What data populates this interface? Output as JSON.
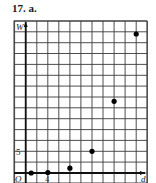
{
  "figure": {
    "title": "17. a."
  },
  "chart_data": {
    "type": "scatter",
    "title": "17. a.",
    "xlabel": "d",
    "ylabel": "W",
    "origin_label": "O",
    "x_tick_labels": [
      {
        "value": 4,
        "label": "4"
      }
    ],
    "y_tick_labels": [
      {
        "value": 5,
        "label": "5"
      }
    ],
    "x_grid_step": 2,
    "y_grid_step": 2.5,
    "xlim": [
      -2,
      22
    ],
    "ylim": [
      -2.5,
      35
    ],
    "grid": true,
    "legend": null,
    "series": [
      {
        "name": "W vs d",
        "points": [
          {
            "x": 1,
            "y": 0
          },
          {
            "x": 4,
            "y": 0.1
          },
          {
            "x": 8,
            "y": 1.1
          },
          {
            "x": 12,
            "y": 5
          },
          {
            "x": 16,
            "y": 16.5
          },
          {
            "x": 20,
            "y": 32
          }
        ]
      }
    ]
  },
  "colors": {
    "grid": "#3a3a3a",
    "axis": "#111111",
    "point": "#000000"
  }
}
